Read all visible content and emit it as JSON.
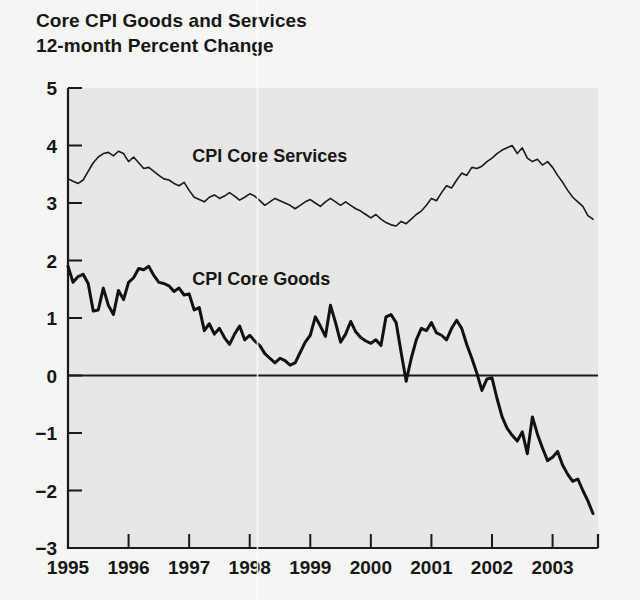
{
  "figure": {
    "title_line1": "Core CPI Goods and Services",
    "title_line2": "12-month Percent Change",
    "background_color": "#f6f6f4",
    "plot_background_color": "#e8e8e6",
    "axis_color": "#1a1a1a"
  },
  "chart_data": {
    "type": "line",
    "title": "Core CPI Goods and Services 12-month Percent Change",
    "subtitle": "12-month Percent Change",
    "xlabel": "",
    "ylabel": "",
    "xlim": [
      1995.0,
      2003.75
    ],
    "ylim": [
      -3,
      5
    ],
    "yticks": [
      5,
      4,
      3,
      2,
      1,
      0,
      -1,
      -2,
      -3
    ],
    "ytick_labels": [
      "5",
      "4",
      "3",
      "2",
      "1",
      "0",
      "−1",
      "−2",
      "−3"
    ],
    "xticks": [
      1995,
      1996,
      1997,
      1998,
      1999,
      2000,
      2001,
      2002,
      2003
    ],
    "xtick_labels": [
      "1995",
      "1996",
      "1997",
      "1998",
      "1999",
      "2000",
      "2001",
      "2002",
      "2003"
    ],
    "grid": false,
    "legend_position": "inline-annotation",
    "zero_reference_line": 0,
    "series": [
      {
        "name": "CPI Core Services",
        "label": "CPI Core Services",
        "line_width": 1.6,
        "color": "#1a1a1a",
        "label_x": 1997.05,
        "label_y": 3.72,
        "x": [
          1995.0,
          1995.083,
          1995.167,
          1995.25,
          1995.333,
          1995.417,
          1995.5,
          1995.583,
          1995.667,
          1995.75,
          1995.833,
          1995.917,
          1996.0,
          1996.083,
          1996.167,
          1996.25,
          1996.333,
          1996.417,
          1996.5,
          1996.583,
          1996.667,
          1996.75,
          1996.833,
          1996.917,
          1997.0,
          1997.083,
          1997.167,
          1997.25,
          1997.333,
          1997.417,
          1997.5,
          1997.583,
          1997.667,
          1997.75,
          1997.833,
          1997.917,
          1998.0,
          1998.083,
          1998.167,
          1998.25,
          1998.333,
          1998.417,
          1998.5,
          1998.583,
          1998.667,
          1998.75,
          1998.833,
          1998.917,
          1999.0,
          1999.083,
          1999.167,
          1999.25,
          1999.333,
          1999.417,
          1999.5,
          1999.583,
          1999.667,
          1999.75,
          1999.833,
          1999.917,
          2000.0,
          2000.083,
          2000.167,
          2000.25,
          2000.333,
          2000.417,
          2000.5,
          2000.583,
          2000.667,
          2000.75,
          2000.833,
          2000.917,
          2001.0,
          2001.083,
          2001.167,
          2001.25,
          2001.333,
          2001.417,
          2001.5,
          2001.583,
          2001.667,
          2001.75,
          2001.833,
          2001.917,
          2002.0,
          2002.083,
          2002.167,
          2002.25,
          2002.333,
          2002.417,
          2002.5,
          2002.583,
          2002.667,
          2002.75,
          2002.833,
          2002.917,
          2003.0,
          2003.083,
          2003.167,
          2003.25,
          2003.333,
          2003.417,
          2003.5,
          2003.583,
          2003.667
        ],
        "y": [
          3.42,
          3.38,
          3.34,
          3.4,
          3.55,
          3.7,
          3.8,
          3.86,
          3.88,
          3.82,
          3.9,
          3.86,
          3.72,
          3.8,
          3.7,
          3.6,
          3.62,
          3.55,
          3.48,
          3.42,
          3.4,
          3.34,
          3.3,
          3.36,
          3.22,
          3.1,
          3.06,
          3.02,
          3.1,
          3.14,
          3.08,
          3.12,
          3.18,
          3.12,
          3.05,
          3.1,
          3.16,
          3.12,
          3.04,
          2.96,
          3.02,
          3.08,
          3.04,
          3.0,
          2.96,
          2.9,
          2.96,
          3.02,
          3.06,
          3.0,
          2.94,
          3.02,
          3.08,
          3.02,
          2.96,
          3.02,
          2.96,
          2.9,
          2.86,
          2.8,
          2.74,
          2.8,
          2.72,
          2.66,
          2.62,
          2.6,
          2.68,
          2.64,
          2.72,
          2.8,
          2.86,
          2.96,
          3.08,
          3.04,
          3.18,
          3.3,
          3.26,
          3.4,
          3.52,
          3.48,
          3.62,
          3.6,
          3.64,
          3.72,
          3.78,
          3.86,
          3.92,
          3.96,
          4.0,
          3.86,
          3.96,
          3.78,
          3.72,
          3.76,
          3.66,
          3.72,
          3.62,
          3.48,
          3.36,
          3.22,
          3.1,
          3.02,
          2.94,
          2.78,
          2.72
        ],
        "notes": "Starts near 3.4 in 1995, peaks ~3.9 mid-1995, eases to ~2.6 trough in mid-2000, rebounds to ~4.0 peak in mid-2002, falls to ~2.7 at end of 2003."
      },
      {
        "name": "CPI Core Goods",
        "label": "CPI Core Goods",
        "line_width": 3.0,
        "color": "#111111",
        "label_x": 1997.05,
        "label_y": 1.58,
        "x": [
          1995.0,
          1995.083,
          1995.167,
          1995.25,
          1995.333,
          1995.417,
          1995.5,
          1995.583,
          1995.667,
          1995.75,
          1995.833,
          1995.917,
          1996.0,
          1996.083,
          1996.167,
          1996.25,
          1996.333,
          1996.417,
          1996.5,
          1996.583,
          1996.667,
          1996.75,
          1996.833,
          1996.917,
          1997.0,
          1997.083,
          1997.167,
          1997.25,
          1997.333,
          1997.417,
          1997.5,
          1997.583,
          1997.667,
          1997.75,
          1997.833,
          1997.917,
          1998.0,
          1998.083,
          1998.167,
          1998.25,
          1998.333,
          1998.417,
          1998.5,
          1998.583,
          1998.667,
          1998.75,
          1998.833,
          1998.917,
          1999.0,
          1999.083,
          1999.167,
          1999.25,
          1999.333,
          1999.417,
          1999.5,
          1999.583,
          1999.667,
          1999.75,
          1999.833,
          1999.917,
          2000.0,
          2000.083,
          2000.167,
          2000.25,
          2000.333,
          2000.417,
          2000.5,
          2000.583,
          2000.667,
          2000.75,
          2000.833,
          2000.917,
          2001.0,
          2001.083,
          2001.167,
          2001.25,
          2001.333,
          2001.417,
          2001.5,
          2001.583,
          2001.667,
          2001.75,
          2001.833,
          2001.917,
          2002.0,
          2002.083,
          2002.167,
          2002.25,
          2002.333,
          2002.417,
          2002.5,
          2002.583,
          2002.667,
          2002.75,
          2002.833,
          2002.917,
          2003.0,
          2003.083,
          2003.167,
          2003.25,
          2003.333,
          2003.417,
          2003.5,
          2003.583,
          2003.667
        ],
        "y": [
          1.9,
          1.62,
          1.72,
          1.76,
          1.6,
          1.12,
          1.14,
          1.52,
          1.22,
          1.06,
          1.48,
          1.32,
          1.62,
          1.7,
          1.86,
          1.84,
          1.9,
          1.74,
          1.62,
          1.6,
          1.56,
          1.46,
          1.52,
          1.4,
          1.42,
          1.14,
          1.18,
          0.78,
          0.9,
          0.72,
          0.82,
          0.66,
          0.54,
          0.72,
          0.86,
          0.62,
          0.7,
          0.6,
          0.52,
          0.38,
          0.3,
          0.22,
          0.3,
          0.26,
          0.18,
          0.22,
          0.4,
          0.58,
          0.7,
          1.02,
          0.86,
          0.68,
          1.22,
          0.92,
          0.58,
          0.72,
          0.94,
          0.76,
          0.66,
          0.6,
          0.56,
          0.62,
          0.52,
          1.02,
          1.06,
          0.92,
          0.4,
          -0.1,
          0.3,
          0.62,
          0.82,
          0.78,
          0.92,
          0.74,
          0.7,
          0.62,
          0.82,
          0.96,
          0.82,
          0.54,
          0.3,
          0.04,
          -0.26,
          -0.06,
          -0.04,
          -0.4,
          -0.72,
          -0.92,
          -1.04,
          -1.14,
          -0.98,
          -1.36,
          -0.72,
          -1.02,
          -1.26,
          -1.48,
          -1.42,
          -1.32,
          -1.56,
          -1.72,
          -1.84,
          -1.8,
          -2.0,
          -2.18,
          -2.4
        ],
        "notes": "Starts ~1.9 in 1995, oscillates down to ~1.1, re-peaks ~1.9 in early 1996, declines through late 1990s, hovers 0.2-1.2 with a dip to -0.1 in 2000, crosses zero permanently in late 2001, falling to about -2.4 by late 2003."
      }
    ]
  }
}
